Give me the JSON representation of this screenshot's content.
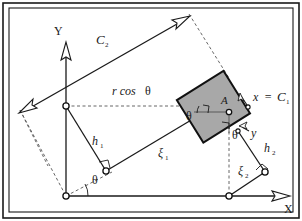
{
  "figure": {
    "type": "kinematic-geometry-diagram",
    "background_color": "#ffffff",
    "line_color": "#1a1a1a",
    "dashed_color": "#555555",
    "body_fill_color": "#a8a8a8",
    "body_stroke_color": "#111111",
    "frame": {
      "outer_border_color": "#1a1a1a",
      "inner_border_color": "#1a1a1a"
    },
    "axes": {
      "y_label": "Y",
      "x_label": "X",
      "arrow_style": "hollow-outline"
    },
    "labels": {
      "c2": "C",
      "c2_sub": "2",
      "c1_equation_lhs": "x",
      "c1_equation_eq": "=",
      "c1_equation_rhs": "C",
      "c1_sub": "1",
      "r_cos_theta": "r cos",
      "theta_glyph": "θ",
      "h1": "h",
      "h1_sub": "1",
      "h2": "h",
      "h2_sub": "2",
      "xi1": "ξ",
      "xi1_sub": "1",
      "xi2": "ξ",
      "xi2_sub": "2",
      "point_a": "A",
      "local_x": "x",
      "local_y": "y"
    },
    "angles": [
      {
        "name": "theta-at-origin",
        "label": "θ"
      },
      {
        "name": "theta-at-body-left",
        "label": "θ"
      },
      {
        "name": "theta-at-body-bottom",
        "label": "θ"
      }
    ],
    "nodes": [
      {
        "name": "origin-node"
      },
      {
        "name": "y-axis-pivot-node"
      },
      {
        "name": "h1-xi1-joint-node"
      },
      {
        "name": "point-a-node"
      },
      {
        "name": "h2-xi2-joint-node"
      },
      {
        "name": "x-axis-node"
      },
      {
        "name": "local-x-node"
      },
      {
        "name": "local-y-node"
      }
    ]
  }
}
